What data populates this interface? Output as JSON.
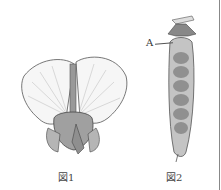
{
  "figure1": {
    "caption": "図1",
    "subject": "pea flower"
  },
  "figure2": {
    "caption": "図2",
    "subject": "pea pod",
    "label_a": "A"
  },
  "colors": {
    "outline": "#555555",
    "fill_light": "#f4f4f4",
    "pod_fill": "#bdbdbd",
    "seed": "#8a8a8a"
  }
}
